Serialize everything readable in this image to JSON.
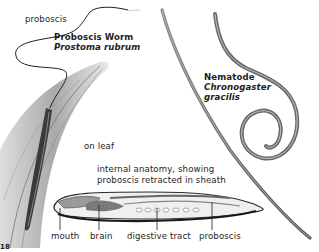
{
  "figure": {
    "proboscis_worm": {
      "common_name": "Proboscis Worm",
      "scientific_name": "Prostoma rubrum",
      "proboscis_label": "proboscis",
      "habitat_label": "on leaf"
    },
    "nematode": {
      "common_name": "Nematode",
      "genus": "Chronogaster",
      "species": "gracilis"
    },
    "internal_anatomy": {
      "caption_line1": "internal anatomy, showing",
      "caption_line2": "proboscis retracted in sheath",
      "parts": [
        "mouth",
        "brain",
        "digestive tract",
        "proboscis"
      ]
    },
    "page_number_fragment": "18"
  },
  "colors": {
    "ink": "#1e1e1e",
    "worm_gray": "#6a6a6a",
    "leaf_gray": "#b8b8b8",
    "background": "#ffffff"
  }
}
